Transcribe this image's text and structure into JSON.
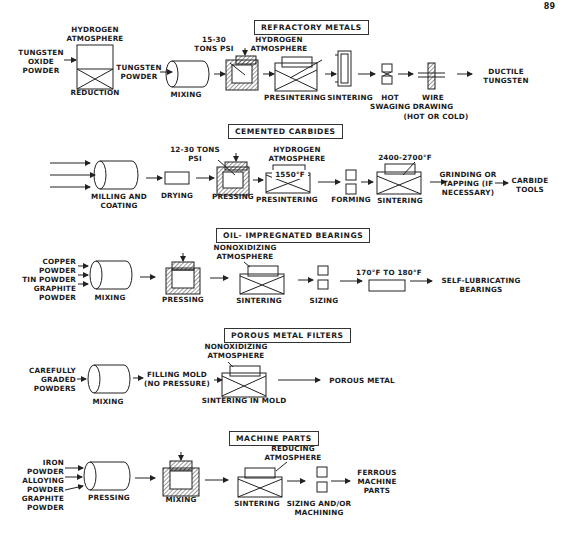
{
  "page_number": "89",
  "sections": [
    {
      "title": "REFRACTORY METALS",
      "labels": {
        "atmosphere": "HYDROGEN ATMOSPHERE",
        "input": "TUNGSTEN OXIDE POWDER",
        "reduction": "REDUCTION",
        "powder": "TUNGSTEN POWDER",
        "mixing": "MIXING",
        "pressure": "15-30 TONS PSI",
        "atmosphere2": "HYDROGEN ATMOSPHERE",
        "presintering": "PRESINTERING",
        "sintering": "SINTERING",
        "swaging": "HOT SWAGING",
        "drawing": "WIRE DRAWING",
        "drawing_note": "(HOT OR COLD)",
        "output": "DUCTILE TUNGSTEN"
      }
    },
    {
      "title": "CEMENTED CARBIDES",
      "labels": {
        "milling": "MILLING AND COATING",
        "drying": "DRYING",
        "pressure": "12-30 TONS PSI",
        "pressing": "PRESSING",
        "atmosphere": "HYDROGEN ATMOSPHERE",
        "temp1": "1550°F",
        "presintering": "PRESINTERING",
        "forming": "FORMING",
        "temp2": "2400-2700°F",
        "sintering": "SINTERING",
        "grinding": "GRINDING OR TAPPING (IF NECESSARY)",
        "output": "CARBIDE TOOLS"
      }
    },
    {
      "title": "OIL- IMPREGNATED BEARINGS",
      "labels": {
        "input1": "COPPER POWDER",
        "input2": "TIN POWDER",
        "input3": "GRAPHITE POWDER",
        "mixing": "MIXING",
        "pressing": "PRESSING",
        "atmosphere": "NONOXIDIZING ATMOSPHERE",
        "sintering": "SINTERING",
        "sizing": "SIZING",
        "temp": "170°F TO 180°F",
        "output": "SELF-LUBRICATING BEARINGS"
      }
    },
    {
      "title": "POROUS METAL FILTERS",
      "labels": {
        "input": "CAREFULLY GRADED POWDERS",
        "mixing": "MIXING",
        "filling": "FILLING MOLD (NO PRESSURE)",
        "atmosphere": "NONOXIDIZING ATMOSPHERE",
        "sintering": "SINTERING IN MOLD",
        "output": "POROUS METAL"
      }
    },
    {
      "title": "MACHINE PARTS",
      "labels": {
        "input1": "IRON POWDER",
        "input2": "ALLOYING POWDER",
        "input3": "GRAPHITE POWDER",
        "pressing": "PRESSING",
        "mixing": "MIXING",
        "atmosphere": "REDUCING ATMOSPHERE",
        "sintering": "SINTERING",
        "sizing": "SIZING AND/OR MACHINING",
        "output": "FERROUS MACHINE PARTS"
      }
    }
  ]
}
